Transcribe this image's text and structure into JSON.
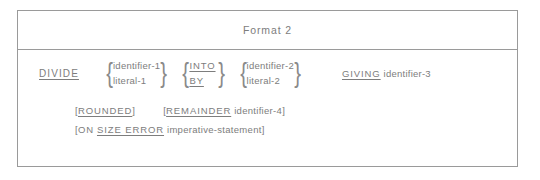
{
  "figure": {
    "title": "Format 2",
    "statement": {
      "verb": "DIVIDE",
      "operand_group_1": {
        "option_a": "identifier-1",
        "option_b": "literal-1"
      },
      "connector_group": {
        "option_a": "INTO",
        "option_b": "BY"
      },
      "operand_group_2": {
        "option_a": "identifier-2",
        "option_b": "literal-2"
      },
      "giving_keyword": "GIVING",
      "giving_operand": "identifier-3"
    },
    "optional_clauses": {
      "rounded": {
        "open_bracket": "[",
        "keyword": "ROUNDED",
        "close_bracket": "]"
      },
      "remainder": {
        "open_bracket": "[",
        "keyword": "REMAINDER",
        "operand": "identifier-4",
        "close_bracket": "]"
      },
      "on_size_error": {
        "open_bracket": "[",
        "on_word": "ON",
        "keyword": "SIZE ERROR",
        "operand": "imperative-statement",
        "close_bracket": "]"
      }
    },
    "braces": {
      "left": "{",
      "right": "}"
    }
  },
  "colors": {
    "text": "#7d7d7d",
    "border": "#9a9a9a",
    "background": "#ffffff"
  }
}
